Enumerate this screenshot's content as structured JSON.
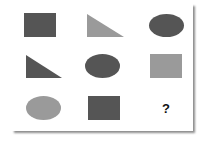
{
  "puzzle": {
    "rows": 3,
    "columns": 3,
    "colors": {
      "dark": "#555555",
      "light": "#9a9a9a"
    },
    "cells": [
      {
        "row": 1,
        "col": 1,
        "shape": "square",
        "shade": "dark"
      },
      {
        "row": 1,
        "col": 2,
        "shape": "right-triangle",
        "shade": "light"
      },
      {
        "row": 1,
        "col": 3,
        "shape": "ellipse",
        "shade": "dark"
      },
      {
        "row": 2,
        "col": 1,
        "shape": "right-triangle",
        "shade": "dark"
      },
      {
        "row": 2,
        "col": 2,
        "shape": "ellipse",
        "shade": "dark"
      },
      {
        "row": 2,
        "col": 3,
        "shape": "square",
        "shade": "light"
      },
      {
        "row": 3,
        "col": 1,
        "shape": "ellipse",
        "shade": "light"
      },
      {
        "row": 3,
        "col": 2,
        "shape": "square",
        "shade": "dark"
      },
      {
        "row": 3,
        "col": 3,
        "shape": "unknown",
        "label": "?"
      }
    ],
    "missing_label": "?"
  }
}
